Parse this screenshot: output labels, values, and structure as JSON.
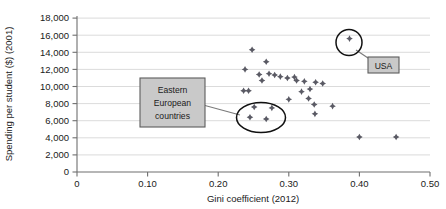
{
  "chart_data": {
    "type": "scatter",
    "title": "",
    "xlabel": "Gini coefficient (2012)",
    "ylabel": "Spending per student ($) (2001)",
    "xlim": [
      0,
      0.5
    ],
    "ylim": [
      0,
      18000
    ],
    "xticks": [
      "0",
      "0.10",
      "0.20",
      "0.30",
      "0.40",
      "0.50"
    ],
    "xtick_values": [
      0,
      0.1,
      0.2,
      0.3,
      0.4,
      0.5
    ],
    "yticks": [
      "0",
      "2,000",
      "4,000",
      "6,000",
      "8,000",
      "10,000",
      "12,000",
      "14,000",
      "16,000",
      "18,000"
    ],
    "ytick_values": [
      0,
      2000,
      4000,
      6000,
      8000,
      10000,
      12000,
      14000,
      16000,
      18000
    ],
    "grid": true,
    "legend": "none",
    "marker_color": "#5a5a64",
    "points": [
      {
        "x": 0.248,
        "y": 14300
      },
      {
        "x": 0.268,
        "y": 12900
      },
      {
        "x": 0.238,
        "y": 12000
      },
      {
        "x": 0.258,
        "y": 11400
      },
      {
        "x": 0.272,
        "y": 11500
      },
      {
        "x": 0.28,
        "y": 11350
      },
      {
        "x": 0.288,
        "y": 11150
      },
      {
        "x": 0.262,
        "y": 10700
      },
      {
        "x": 0.298,
        "y": 11000
      },
      {
        "x": 0.308,
        "y": 11100
      },
      {
        "x": 0.311,
        "y": 10700
      },
      {
        "x": 0.322,
        "y": 10600
      },
      {
        "x": 0.338,
        "y": 10500
      },
      {
        "x": 0.348,
        "y": 10350
      },
      {
        "x": 0.236,
        "y": 9500
      },
      {
        "x": 0.243,
        "y": 9500
      },
      {
        "x": 0.318,
        "y": 9400
      },
      {
        "x": 0.33,
        "y": 9700
      },
      {
        "x": 0.328,
        "y": 8600
      },
      {
        "x": 0.3,
        "y": 8500
      },
      {
        "x": 0.336,
        "y": 7900
      },
      {
        "x": 0.362,
        "y": 7700
      },
      {
        "x": 0.337,
        "y": 6800
      },
      {
        "x": 0.251,
        "y": 7600
      },
      {
        "x": 0.276,
        "y": 7500
      },
      {
        "x": 0.245,
        "y": 6400
      },
      {
        "x": 0.268,
        "y": 6200
      },
      {
        "x": 0.386,
        "y": 15600
      },
      {
        "x": 0.4,
        "y": 4100
      },
      {
        "x": 0.452,
        "y": 4100
      }
    ],
    "annotations": [
      {
        "name": "usa-callout",
        "label": "USA",
        "shape": "circle",
        "target_x": 0.386,
        "target_y": 15600
      },
      {
        "name": "eastern-europe-callout",
        "label_lines": [
          "Eastern",
          "European",
          "countries"
        ],
        "shape": "ellipse",
        "center_x": 0.2565,
        "center_y": 6900
      }
    ]
  }
}
